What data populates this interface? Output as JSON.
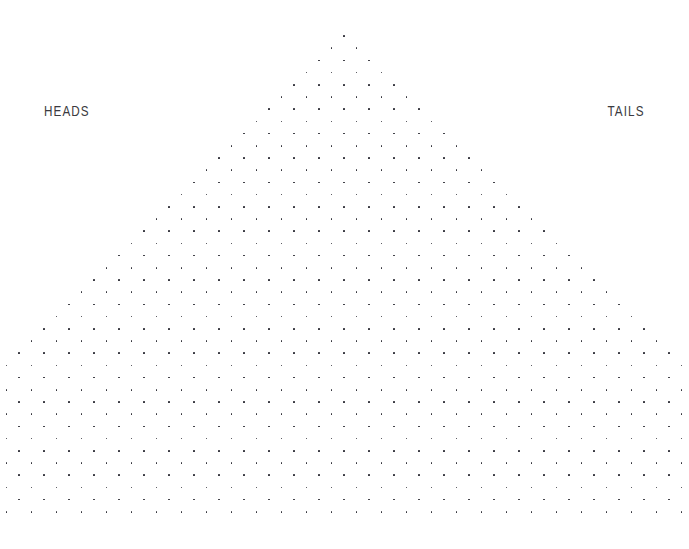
{
  "canvas": {
    "width": 689,
    "height": 549,
    "background": "#ffffff"
  },
  "labels": {
    "left": "HEADS",
    "right": "TAILS",
    "color": "#3a3a40"
  },
  "chart_data": {
    "type": "scatter",
    "title": "",
    "subtitle": "",
    "xlabel": "",
    "ylabel": "",
    "annotations": [
      "HEADS",
      "TAILS"
    ],
    "legend": [],
    "grid": false,
    "lattice": {
      "apex_x": 344,
      "apex_y": 36,
      "row_pitch_y": 12.2,
      "column_pitch_x": 25.0,
      "half_offset_x": 12.5,
      "rows": 40,
      "dots_in_row_n": "n + 1",
      "bottom_clip_y": 518,
      "dot_radius_px": 0.85,
      "dot_color": "#2b2b33",
      "first_row_dots": 1,
      "last_visible_row_dots": 40,
      "left_edge_x": 33,
      "right_edge_x": 655,
      "last_row_y": 512
    }
  }
}
